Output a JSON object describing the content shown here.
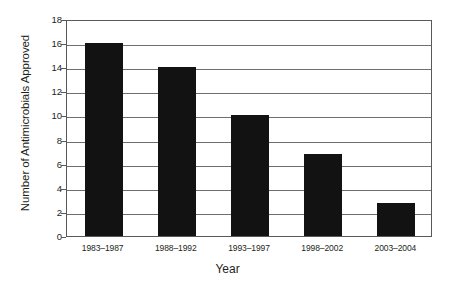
{
  "chart_data": {
    "type": "bar",
    "title": "",
    "xlabel": "Year",
    "ylabel": "Number of Antimicrobials Approved",
    "categories": [
      "1983–1987",
      "1988–1992",
      "1993–1997",
      "1998–2002",
      "2003–2004"
    ],
    "values": [
      16,
      14,
      10,
      6.8,
      2.7
    ],
    "ylim": [
      0,
      18
    ],
    "ytick_labels": [
      "0",
      "2",
      "4",
      "6",
      "8",
      "10",
      "12",
      "14",
      "16",
      "18"
    ],
    "ytick_values": [
      0,
      2,
      4,
      6,
      8,
      10,
      12,
      14,
      16,
      18
    ],
    "grid": true,
    "legend": false,
    "bar_color": "#121212",
    "axis_color": "#58595b",
    "grid_color": "#6d6e71"
  }
}
